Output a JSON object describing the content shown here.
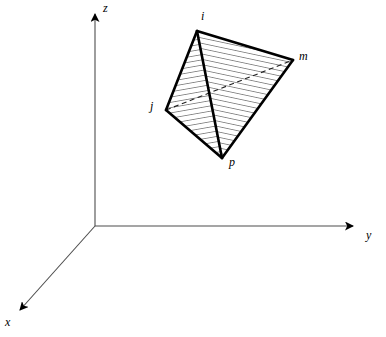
{
  "figure": {
    "type": "3d-line-diagram",
    "background_color": "#ffffff",
    "stroke_color": "#000000",
    "axis_color": "#4d4d4d",
    "hatch_color": "#1a1a1a"
  },
  "axes": {
    "origin": {
      "x": 95,
      "y": 226
    },
    "items": [
      {
        "name": "z",
        "label": "z",
        "label_x": 103,
        "label_y": 2,
        "tip_x": 95,
        "tip_y": 8
      },
      {
        "name": "y",
        "label": "y",
        "label_x": 366,
        "label_y": 229,
        "tip_x": 360,
        "tip_y": 226
      },
      {
        "name": "x",
        "label": "x",
        "label_x": 5,
        "label_y": 316,
        "tip_x": 14,
        "tip_y": 314
      }
    ]
  },
  "solid": {
    "name": "tetrahedron",
    "vertices": [
      {
        "id": "i",
        "label": "i",
        "x": 197,
        "y": 31,
        "label_x": 201,
        "label_y": 10
      },
      {
        "id": "m",
        "label": "m",
        "x": 293,
        "y": 60,
        "label_x": 299,
        "label_y": 50
      },
      {
        "id": "j",
        "label": "j",
        "x": 166,
        "y": 110,
        "label_x": 150,
        "label_y": 100
      },
      {
        "id": "p",
        "label": "p",
        "x": 222,
        "y": 158,
        "label_x": 229,
        "label_y": 156
      }
    ],
    "edges": [
      {
        "from": "i",
        "to": "j",
        "hidden": false
      },
      {
        "from": "i",
        "to": "m",
        "hidden": false
      },
      {
        "from": "i",
        "to": "p",
        "hidden": false
      },
      {
        "from": "j",
        "to": "p",
        "hidden": false
      },
      {
        "from": "m",
        "to": "p",
        "hidden": false
      },
      {
        "from": "j",
        "to": "m",
        "hidden": true
      }
    ],
    "faces": [
      {
        "name": "face-i-j-p",
        "vertices": [
          "i",
          "j",
          "p"
        ],
        "hatched": true
      },
      {
        "name": "face-i-p-m",
        "vertices": [
          "i",
          "p",
          "m"
        ],
        "hatched": true
      }
    ]
  }
}
